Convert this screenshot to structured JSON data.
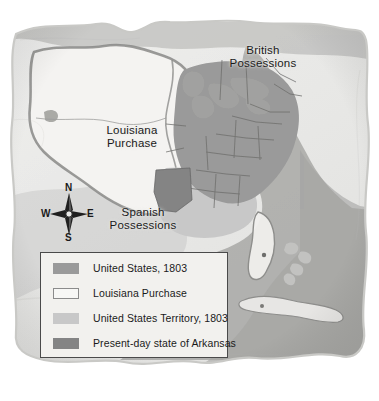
{
  "map": {
    "title_visible": false,
    "background_color": "#ffffff",
    "parchment_color": "#ececeb",
    "parchment_edge_color": "#c9c9c6",
    "ocean_color": "#a8a8a6",
    "region_labels": [
      {
        "name": "louisiana-purchase",
        "line1": "Louisiana",
        "line2": "Purchase"
      },
      {
        "name": "british-possessions",
        "line1": "British",
        "line2": "Possessions"
      },
      {
        "name": "spanish-possessions",
        "line1": "Spanish",
        "line2": "Possessions"
      }
    ],
    "compass": {
      "north": "N",
      "east": "E",
      "south": "S",
      "west": "W"
    },
    "fill_colors": {
      "united_states_1803": "#9a9a9a",
      "louisiana_purchase": "#f4f3f1",
      "united_states_territory_1803": "#c8c8c8",
      "present_day_arkansas": "#848484",
      "foreign_land": "#c0c0be",
      "water": "#a8a8a6",
      "border_line": "#7a7a78",
      "state_line": "#6e6e6c"
    }
  },
  "legend": {
    "border_color": "#4a4a4a",
    "background_color": "#f2f1ee",
    "items": [
      {
        "name": "united-states-1803",
        "label": "United States, 1803",
        "color": "#9a9a9a",
        "style": "solid"
      },
      {
        "name": "louisiana-purchase",
        "label": "Louisiana Purchase",
        "color": "#f7f7f5",
        "style": "outlined"
      },
      {
        "name": "united-states-territory-1803",
        "label": "United States Territory, 1803",
        "color": "#c8c8c8",
        "style": "solid"
      },
      {
        "name": "present-day-state-of-arkansas",
        "label": "Present-day state of Arkansas",
        "color": "#848484",
        "style": "solid"
      }
    ]
  }
}
